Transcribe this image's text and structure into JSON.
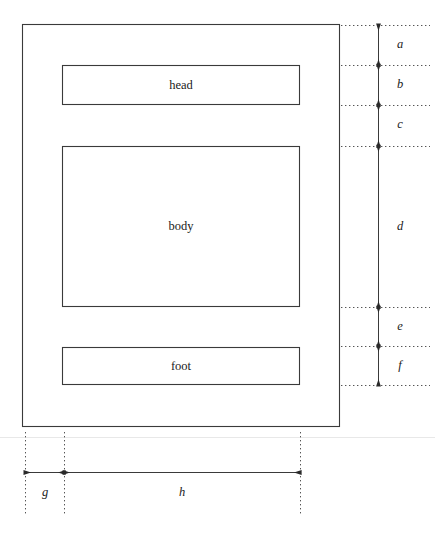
{
  "diagram": {
    "stroke_color": "#3a3a3a",
    "dotted_color": "#555555",
    "rule_color": "#e8e8e8",
    "boxes": [
      {
        "name": "page",
        "label": "",
        "x": 22,
        "y": 24,
        "width": 318,
        "height": 403
      },
      {
        "name": "head",
        "label": "head",
        "x": 62,
        "y": 65,
        "width": 238,
        "height": 40
      },
      {
        "name": "body",
        "label": "body",
        "x": 62,
        "y": 146,
        "width": 238,
        "height": 161
      },
      {
        "name": "foot",
        "label": "foot",
        "x": 62,
        "y": 347,
        "width": 238,
        "height": 38
      }
    ],
    "vertical_dimensions": {
      "axis_x": 378,
      "extension_start_x": 341,
      "extension_end_x": 430,
      "label_x": 400,
      "segments": [
        {
          "label": "a",
          "y_start": 25,
          "y_end": 65
        },
        {
          "label": "b",
          "y_start": 65,
          "y_end": 105
        },
        {
          "label": "c",
          "y_start": 105,
          "y_end": 146
        },
        {
          "label": "d",
          "y_start": 146,
          "y_end": 307
        },
        {
          "label": "e",
          "y_start": 307,
          "y_end": 346
        },
        {
          "label": "f",
          "y_start": 346,
          "y_end": 385
        }
      ]
    },
    "horizontal_dimensions": {
      "axis_y": 472,
      "extension_top_y": 432,
      "extension_bottom_y": 515,
      "label_y": 492,
      "segments": [
        {
          "label": "g",
          "x_start": 25,
          "x_end": 64
        },
        {
          "label": "h",
          "x_start": 64,
          "x_end": 300
        }
      ]
    },
    "page_rule": {
      "y": 437,
      "x_start": 0,
      "x_end": 435
    }
  }
}
